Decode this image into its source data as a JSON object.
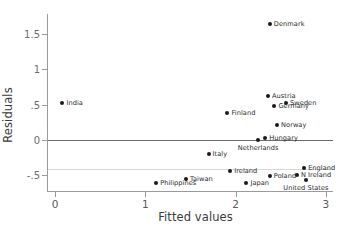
{
  "chart_data": {
    "type": "scatter",
    "title": "",
    "xlabel": "Fitted values",
    "ylabel": "Residuals",
    "xlim": [
      -0.08,
      3.08
    ],
    "ylim": [
      -0.72,
      1.78
    ],
    "xticks": [
      "0",
      "1",
      "2",
      "3"
    ],
    "xtick_values": [
      0,
      1,
      2,
      3
    ],
    "yticks": [
      "1.5",
      "1",
      ".5",
      "0",
      "-.5"
    ],
    "ytick_values": [
      1.5,
      1,
      0.5,
      0,
      -0.5
    ],
    "grid": false,
    "reference_lines": [
      {
        "name": "zero-line",
        "y": 0,
        "color": "#6a6a6a"
      },
      {
        "name": "lower-grid-line",
        "y": -0.41,
        "color": "#d7d7d7"
      }
    ],
    "legend": "none",
    "marker_color": "#1a1a1a",
    "points": [
      {
        "label": "India",
        "x": 0.08,
        "y": 0.52,
        "label_pos": "right"
      },
      {
        "label": "Philippines",
        "x": 1.12,
        "y": -0.6,
        "label_pos": "right"
      },
      {
        "label": "Taiwan",
        "x": 1.45,
        "y": -0.55,
        "label_pos": "right"
      },
      {
        "label": "Italy",
        "x": 1.7,
        "y": -0.2,
        "label_pos": "right"
      },
      {
        "label": "Finland",
        "x": 1.91,
        "y": 0.375,
        "label_pos": "right"
      },
      {
        "label": "Ireland",
        "x": 1.94,
        "y": -0.44,
        "label_pos": "right"
      },
      {
        "label": "Japan",
        "x": 2.12,
        "y": -0.6,
        "label_pos": "right"
      },
      {
        "label": "Netherlands",
        "x": 2.25,
        "y": 0.005,
        "label_pos": "below"
      },
      {
        "label": "Hungary",
        "x": 2.33,
        "y": 0.03,
        "label_pos": "right"
      },
      {
        "label": "Austria",
        "x": 2.36,
        "y": 0.62,
        "label_pos": "right"
      },
      {
        "label": "Poland",
        "x": 2.38,
        "y": -0.51,
        "label_pos": "right"
      },
      {
        "label": "Denmark",
        "x": 2.38,
        "y": 1.64,
        "label_pos": "right"
      },
      {
        "label": "Germany",
        "x": 2.43,
        "y": 0.475,
        "label_pos": "right"
      },
      {
        "label": "Norway",
        "x": 2.46,
        "y": 0.21,
        "label_pos": "right"
      },
      {
        "label": "Sweden",
        "x": 2.56,
        "y": 0.525,
        "label_pos": "right"
      },
      {
        "label": "N Ireland",
        "x": 2.68,
        "y": -0.49,
        "label_pos": "right"
      },
      {
        "label": "England",
        "x": 2.76,
        "y": -0.39,
        "label_pos": "right"
      },
      {
        "label": "United States",
        "x": 2.78,
        "y": -0.57,
        "label_pos": "below"
      }
    ]
  }
}
